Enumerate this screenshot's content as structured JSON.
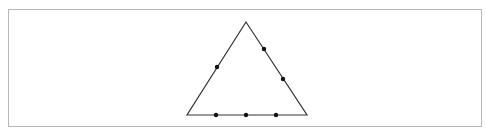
{
  "diagram": {
    "type": "triangle-with-points",
    "stroke_color": "#333333",
    "dot_color": "#111111",
    "frame_color": "#b8b8b8",
    "vertices": [
      {
        "name": "apex",
        "x": 246,
        "y": 22
      },
      {
        "name": "bottom-left",
        "x": 187,
        "y": 115
      },
      {
        "name": "bottom-right",
        "x": 307,
        "y": 115
      }
    ],
    "points": [
      {
        "side": "left",
        "x": 217,
        "y": 67
      },
      {
        "side": "right",
        "x": 264,
        "y": 49
      },
      {
        "side": "right",
        "x": 283,
        "y": 79
      },
      {
        "side": "bottom",
        "x": 216,
        "y": 115
      },
      {
        "side": "bottom",
        "x": 246,
        "y": 115
      },
      {
        "side": "bottom",
        "x": 276,
        "y": 115
      }
    ]
  }
}
